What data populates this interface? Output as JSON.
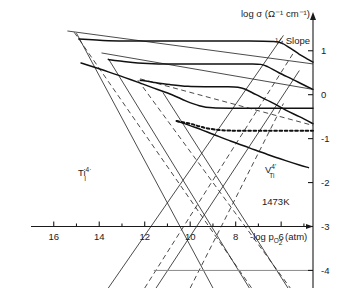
{
  "figure": {
    "title": "",
    "temperature_label": "1473K",
    "slope_annotation": "-¼ Slope",
    "y_axis_title": "log σ (Ω⁻¹ cm⁻¹)",
    "x_axis_title": "-log p",
    "x_axis_title_sub": "O",
    "x_axis_title_sub2": "2",
    "x_axis_title_unit": "(atm)",
    "defect_label_left_base": "Ti",
    "defect_label_left_sub": "I",
    "defect_label_left_sup": "4·",
    "defect_label_right_base": "V",
    "defect_label_right_sub": "Ti",
    "defect_label_right_sup": "4'"
  },
  "chart_data": {
    "type": "line",
    "xlabel": "-log p_O2 (atm)",
    "ylabel": "log sigma (ohm^-1 cm^-1)",
    "xlim": [
      17,
      4.6
    ],
    "ylim": [
      -4.4,
      1.7
    ],
    "x_ticks_major": [
      16,
      14,
      12,
      10,
      8,
      6
    ],
    "x_tick_labels": [
      "16",
      "14",
      "12",
      "10",
      "8",
      "6"
    ],
    "x_ticks_minor": [
      15,
      13,
      11,
      9,
      7,
      5
    ],
    "y_ticks_major": [
      1,
      0,
      -1,
      -2,
      -3,
      -4
    ],
    "y_tick_labels": [
      "1",
      "0",
      "-1",
      "-2",
      "-3",
      "-4"
    ],
    "grid": false,
    "legend_position": "none",
    "axis_origin_y": -3,
    "series": [
      {
        "name": "isotherm-1",
        "style": "solid",
        "plateau_level": 1.22,
        "knee_x": 6.0,
        "slope_after_knee": -0.25,
        "points": [
          [
            14.9,
            1.27
          ],
          [
            14.3,
            1.25
          ],
          [
            13.6,
            1.23
          ],
          [
            12.6,
            1.22
          ],
          [
            11.0,
            1.22
          ],
          [
            9.0,
            1.22
          ],
          [
            7.4,
            1.22
          ],
          [
            6.4,
            1.21
          ],
          [
            6.0,
            1.18
          ],
          [
            5.6,
            1.06
          ],
          [
            5.2,
            0.92
          ],
          [
            4.8,
            0.8
          ],
          [
            4.6,
            0.74
          ]
        ]
      },
      {
        "name": "isotherm-2",
        "style": "solid",
        "plateau_level": 0.7,
        "knee_x": 6.6,
        "slope_after_knee": -0.25,
        "points": [
          [
            13.6,
            0.8
          ],
          [
            13.0,
            0.76
          ],
          [
            12.3,
            0.72
          ],
          [
            11.4,
            0.7
          ],
          [
            10.0,
            0.7
          ],
          [
            8.6,
            0.7
          ],
          [
            7.4,
            0.7
          ],
          [
            6.9,
            0.69
          ],
          [
            6.6,
            0.64
          ],
          [
            6.1,
            0.5
          ],
          [
            5.5,
            0.35
          ],
          [
            5.0,
            0.22
          ],
          [
            4.6,
            0.12
          ]
        ]
      },
      {
        "name": "isotherm-3",
        "style": "solid",
        "plateau_level": 0.18,
        "knee_x": 7.6,
        "slope_after_knee": -0.25,
        "points": [
          [
            12.2,
            0.33
          ],
          [
            11.6,
            0.28
          ],
          [
            10.9,
            0.23
          ],
          [
            10.1,
            0.19
          ],
          [
            9.2,
            0.18
          ],
          [
            8.4,
            0.18
          ],
          [
            7.9,
            0.17
          ],
          [
            7.6,
            0.13
          ],
          [
            7.1,
            0.0
          ],
          [
            6.4,
            -0.18
          ],
          [
            5.8,
            -0.35
          ],
          [
            5.2,
            -0.5
          ],
          [
            4.6,
            -0.66
          ]
        ]
      },
      {
        "name": "isotherm-4",
        "style": "solid",
        "plateau_level": -0.3,
        "knee_x": 10.0,
        "slope_after_knee": 0.0,
        "points": [
          [
            14.8,
            0.72
          ],
          [
            13.6,
            0.52
          ],
          [
            12.6,
            0.34
          ],
          [
            11.6,
            0.15
          ],
          [
            10.8,
            0.0
          ],
          [
            10.2,
            -0.14
          ],
          [
            9.6,
            -0.25
          ],
          [
            9.0,
            -0.3
          ],
          [
            8.0,
            -0.31
          ],
          [
            6.8,
            -0.31
          ],
          [
            5.6,
            -0.31
          ],
          [
            4.6,
            -0.31
          ]
        ]
      },
      {
        "name": "isotherm-5-dotted",
        "style": "dotted",
        "plateau_level": -0.82,
        "knee_x": 9.2,
        "points": [
          [
            10.6,
            -0.6
          ],
          [
            10.0,
            -0.66
          ],
          [
            9.6,
            -0.72
          ],
          [
            9.2,
            -0.77
          ],
          [
            8.6,
            -0.81
          ],
          [
            7.8,
            -0.82
          ],
          [
            6.6,
            -0.82
          ],
          [
            5.4,
            -0.82
          ],
          [
            4.6,
            -0.82
          ]
        ]
      },
      {
        "name": "isotherm-6",
        "style": "solid",
        "plateau_level": null,
        "points": [
          [
            10.6,
            -0.6
          ],
          [
            9.8,
            -0.74
          ],
          [
            9.0,
            -0.9
          ],
          [
            8.2,
            -1.06
          ],
          [
            7.4,
            -1.21
          ],
          [
            6.6,
            -1.36
          ],
          [
            5.8,
            -1.5
          ],
          [
            5.2,
            -1.6
          ],
          [
            4.8,
            -1.66
          ]
        ]
      }
    ],
    "defect_lines": [
      {
        "name": "Ti_I-line-1",
        "style": "solid",
        "slope": "negative",
        "x1": 15.0,
        "y1": 1.4,
        "x2": 9.0,
        "y2": -4.4
      },
      {
        "name": "Ti_I-line-2",
        "style": "dashed",
        "slope": "negative",
        "x1": 15.1,
        "y1": 1.42,
        "x2": 7.3,
        "y2": -4.4
      },
      {
        "name": "Ti_I-line-3",
        "style": "solid",
        "slope": "negative",
        "x1": 13.6,
        "y1": 0.82,
        "x2": 7.4,
        "y2": -4.4
      },
      {
        "name": "Ti_I-line-4",
        "style": "dashed",
        "slope": "negative",
        "x1": 12.3,
        "y1": 0.33,
        "x2": 5.6,
        "y2": -4.4
      },
      {
        "name": "Ti_I-line-5",
        "style": "solid",
        "slope": "negative",
        "x1": 11.2,
        "y1": 0.05,
        "x2": 5.7,
        "y2": -4.4
      },
      {
        "name": "V_Ti-line-1",
        "style": "solid",
        "slope": "positive",
        "x1": 13.6,
        "y1": -4.4,
        "x2": 5.9,
        "y2": 1.35
      },
      {
        "name": "V_Ti-line-2",
        "style": "solid",
        "slope": "positive",
        "x1": 11.5,
        "y1": -4.4,
        "x2": 5.2,
        "y2": 0.55
      },
      {
        "name": "V_Ti-line-3",
        "style": "dashed",
        "slope": "positive",
        "x1": 10.0,
        "y1": -4.4,
        "x2": 5.9,
        "y2": -0.2
      },
      {
        "name": "V_Ti-line-4",
        "style": "dashed",
        "slope": "positive",
        "x1": 12.0,
        "y1": -4.4,
        "x2": 5.4,
        "y2": 1.0
      },
      {
        "name": "quarter-slope-guide-1",
        "style": "solid",
        "slope": "quarter",
        "x1": 15.4,
        "y1": 1.45,
        "x2": 4.6,
        "y2": 0.7
      },
      {
        "name": "quarter-slope-guide-2",
        "style": "solid",
        "slope": "quarter",
        "x1": 13.9,
        "y1": 0.95,
        "x2": 4.6,
        "y2": 0.12
      },
      {
        "name": "quarter-slope-guide-3",
        "style": "dashed",
        "slope": "quarter",
        "x1": 12.2,
        "y1": 0.36,
        "x2": 4.6,
        "y2": -0.7
      }
    ],
    "lower_baseline_y": -4.0
  }
}
